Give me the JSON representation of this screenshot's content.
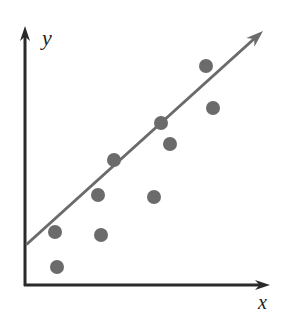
{
  "figure": {
    "background_color": "#ffffff"
  },
  "axes": {
    "color": "#2a2a2a",
    "stroke_width": 3,
    "origin": {
      "x": 25,
      "y": 285
    },
    "y_axis": {
      "name": "y-axis",
      "label": "y",
      "label_position": {
        "x": 42,
        "y": 45
      },
      "from": {
        "x": 25,
        "y": 285
      },
      "to": {
        "x": 25,
        "y": 32
      },
      "arrow_tip": {
        "x": 25,
        "y": 26
      },
      "has_arrow": true
    },
    "x_axis": {
      "name": "x-axis",
      "label": "x",
      "label_position": {
        "x": 258,
        "y": 309
      },
      "from": {
        "x": 25,
        "y": 285
      },
      "to": {
        "x": 262,
        "y": 285
      },
      "arrow_tip": {
        "x": 270,
        "y": 285
      },
      "has_arrow": true
    }
  },
  "trend_line": {
    "name": "trend-line",
    "color": "#6b6b6b",
    "stroke_width": 3,
    "has_arrow": true,
    "from": {
      "x": 27,
      "y": 244
    },
    "to": {
      "x": 255,
      "y": 38
    },
    "arrow_tip": {
      "x": 263,
      "y": 31
    }
  },
  "markers": {
    "color": "#6b6b6b",
    "radius": 7,
    "shape": "circle",
    "count": 10
  },
  "chart_data": {
    "type": "scatter",
    "title": "",
    "subtitle": "",
    "xlabel": "x",
    "ylabel": "y",
    "grid": false,
    "legend": false,
    "axis_ticks": false,
    "xlim": [
      0,
      100
    ],
    "ylim": [
      0,
      100
    ],
    "series": [
      {
        "name": "observations",
        "color": "#6b6b6b",
        "marker": "circle",
        "points": [
          {
            "px": 55,
            "py": 232,
            "x": 12.3,
            "y": 20.5
          },
          {
            "px": 57,
            "py": 267,
            "x": 13.2,
            "y": 7.0
          },
          {
            "px": 98,
            "py": 195,
            "x": 30.0,
            "y": 34.7
          },
          {
            "px": 101,
            "py": 235,
            "x": 31.3,
            "y": 19.3
          },
          {
            "px": 114,
            "py": 160,
            "x": 36.6,
            "y": 48.3
          },
          {
            "px": 154,
            "py": 197,
            "x": 53.1,
            "y": 33.9
          },
          {
            "px": 161,
            "py": 123,
            "x": 55.9,
            "y": 62.5
          },
          {
            "px": 170,
            "py": 144,
            "x": 59.7,
            "y": 54.4
          },
          {
            "px": 206,
            "py": 66,
            "x": 74.5,
            "y": 84.6
          },
          {
            "px": 213,
            "py": 108,
            "x": 77.4,
            "y": 68.3
          }
        ]
      }
    ],
    "trend": {
      "name": "line of best fit",
      "color": "#6b6b6b",
      "direction": "positive",
      "from": {
        "px": 27,
        "py": 244,
        "x": 0.8,
        "y": 15.8
      },
      "to": {
        "px": 263,
        "py": 31,
        "x": 98.0,
        "y": 97.8
      }
    }
  }
}
